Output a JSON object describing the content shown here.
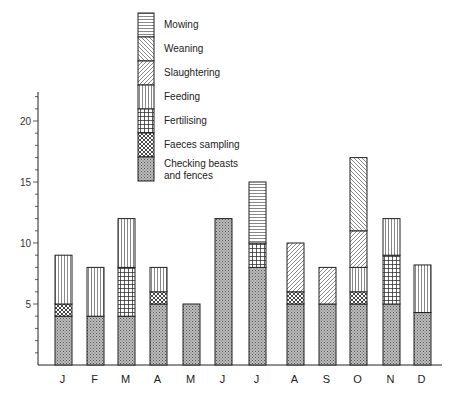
{
  "chart_data": {
    "type": "bar",
    "stacked": true,
    "title": "",
    "xlabel": "",
    "ylabel": "",
    "ylim": [
      0,
      23
    ],
    "yticks": [
      5,
      10,
      15,
      20
    ],
    "grid": false,
    "legend_position": "top-center",
    "categories": [
      "J",
      "F",
      "M",
      "A",
      "M",
      "J",
      "J",
      "A",
      "S",
      "O",
      "N",
      "D"
    ],
    "series": [
      {
        "name": "Checking beasts and fences",
        "pattern": "dots",
        "values": [
          4,
          4,
          4,
          5,
          5,
          12,
          8,
          5,
          5,
          5,
          5,
          4.3
        ]
      },
      {
        "name": "Faeces sampling",
        "pattern": "crosshatch",
        "values": [
          1,
          0,
          0,
          1,
          0,
          0,
          0,
          1,
          0,
          1,
          0,
          0
        ]
      },
      {
        "name": "Fertilising",
        "pattern": "grid",
        "values": [
          0,
          0,
          4,
          0,
          0,
          0,
          2,
          0,
          0,
          0,
          4,
          0
        ]
      },
      {
        "name": "Feeding",
        "pattern": "vertical",
        "values": [
          4,
          4,
          4,
          2,
          0,
          0,
          0,
          0,
          0,
          2,
          3,
          3.9
        ]
      },
      {
        "name": "Slaughtering",
        "pattern": "diag-forward",
        "values": [
          0,
          0,
          0,
          0,
          0,
          0,
          0,
          4,
          3,
          3,
          0,
          0
        ]
      },
      {
        "name": "Weaning",
        "pattern": "diag-back",
        "values": [
          0,
          0,
          0,
          0,
          0,
          0,
          0,
          0,
          0,
          6,
          0,
          0
        ]
      },
      {
        "name": "Mowing",
        "pattern": "horizontal",
        "values": [
          0,
          0,
          0,
          0,
          0,
          0,
          5,
          0,
          0,
          0,
          0,
          0
        ]
      }
    ],
    "legend": [
      {
        "label": "Mowing",
        "pattern": "horizontal"
      },
      {
        "label": "Weaning",
        "pattern": "diag-back"
      },
      {
        "label": "Slaughtering",
        "pattern": "diag-forward"
      },
      {
        "label": "Feeding",
        "pattern": "vertical"
      },
      {
        "label": "Fertilising",
        "pattern": "grid"
      },
      {
        "label": "Faeces sampling",
        "pattern": "crosshatch"
      },
      {
        "label": "Checking beasts",
        "label2": "and fences",
        "pattern": "dots"
      }
    ]
  }
}
